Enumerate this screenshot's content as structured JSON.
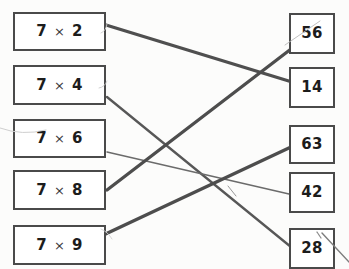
{
  "worksheet": {
    "title": "Multiplication matching worksheet",
    "instruction_visible": false,
    "background_color": "#fdfdfd",
    "ink_color": "#4a4a4a"
  },
  "left_column": {
    "name": "problems",
    "items": [
      {
        "id": "p1",
        "label": "7 × 2",
        "factor_a": "7",
        "operator": "×",
        "factor_b": "2",
        "x": 13,
        "y": 12,
        "w": 93,
        "h": 39
      },
      {
        "id": "p2",
        "label": "7 × 4",
        "factor_a": "7",
        "operator": "×",
        "factor_b": "4",
        "x": 13,
        "y": 65,
        "w": 93,
        "h": 40
      },
      {
        "id": "p3",
        "label": "7 × 6",
        "factor_a": "7",
        "operator": "×",
        "factor_b": "6",
        "x": 13,
        "y": 119,
        "w": 93,
        "h": 39
      },
      {
        "id": "p4",
        "label": "7 × 8",
        "factor_a": "7",
        "operator": "×",
        "factor_b": "8",
        "x": 13,
        "y": 170,
        "w": 93,
        "h": 40
      },
      {
        "id": "p5",
        "label": "7 × 9",
        "factor_a": "7",
        "operator": "×",
        "factor_b": "9",
        "x": 13,
        "y": 225,
        "w": 93,
        "h": 40
      }
    ]
  },
  "right_column": {
    "name": "answers",
    "items": [
      {
        "id": "a56",
        "label": "56",
        "x": 289,
        "y": 13,
        "w": 46,
        "h": 41
      },
      {
        "id": "a14",
        "label": "14",
        "x": 289,
        "y": 67,
        "w": 46,
        "h": 41
      },
      {
        "id": "a63",
        "label": "63",
        "x": 289,
        "y": 125,
        "w": 46,
        "h": 39
      },
      {
        "id": "a42",
        "label": "42",
        "x": 289,
        "y": 172,
        "w": 46,
        "h": 41
      },
      {
        "id": "a28",
        "label": "28",
        "x": 289,
        "y": 228,
        "w": 46,
        "h": 41
      }
    ]
  },
  "connections": [
    {
      "id": "c1",
      "from": "p1",
      "to": "a14",
      "x1": 106,
      "y1": 25,
      "x2": 292,
      "y2": 82,
      "width": 3.2,
      "color": "#4f4f4f"
    },
    {
      "id": "c2",
      "from": "p2",
      "to": "a28",
      "x1": 107,
      "y1": 97,
      "x2": 291,
      "y2": 247,
      "width": 2.3,
      "color": "#575757"
    },
    {
      "id": "c3",
      "from": "p3",
      "to": "a42",
      "x1": 107,
      "y1": 152,
      "x2": 289,
      "y2": 194,
      "width": 1.5,
      "color": "#6b6b6b"
    },
    {
      "id": "c4",
      "from": "p4",
      "to": "a56",
      "x1": 107,
      "y1": 190,
      "x2": 291,
      "y2": 49,
      "width": 3.3,
      "color": "#4d4d4d"
    },
    {
      "id": "c5",
      "from": "p5",
      "to": "a63",
      "x1": 97,
      "y1": 238,
      "x2": 291,
      "y2": 147,
      "width": 3.4,
      "color": "#4d4d4d"
    }
  ],
  "stray_marks": [
    {
      "id": "s1",
      "description": "faint-pencil-arc-left-edge",
      "d": "M 0 128 Q 22 136 46 130",
      "width": 1.0,
      "color": "#cfcfcf"
    },
    {
      "id": "s2",
      "description": "faint-tick-top-right-of-first-card",
      "d": "M 101 33 q 5 -2 6 -9",
      "width": 0.9,
      "color": "#cdcdcd"
    },
    {
      "id": "s3",
      "description": "faint-tick-right-of-second-card",
      "d": "M 99 88 q 6 -1 8 -7",
      "width": 0.9,
      "color": "#cdcdcd"
    },
    {
      "id": "s4",
      "description": "faint-line-near-56-box",
      "d": "M 285 45 L 320 21",
      "width": 0.9,
      "color": "#b9b9b9"
    },
    {
      "id": "s5",
      "description": "thin-stroke-through-42-crossing",
      "d": "M 228 186 L 236 196",
      "width": 0.9,
      "color": "#8c8c8c"
    },
    {
      "id": "s6",
      "description": "stray-line-bottom-right-of-28",
      "d": "M 322 233 L 349 262",
      "width": 1.4,
      "color": "#7d7d7d"
    },
    {
      "id": "s7",
      "description": "short-tick-above-28",
      "d": "M 317 232 l 4 6",
      "width": 1.2,
      "color": "#8a8a8a"
    },
    {
      "id": "s8",
      "description": "faint-arc-right-of-ninth-card",
      "d": "M 101 229 q 7 3 11 10",
      "width": 0.9,
      "color": "#d2d2d2"
    }
  ]
}
